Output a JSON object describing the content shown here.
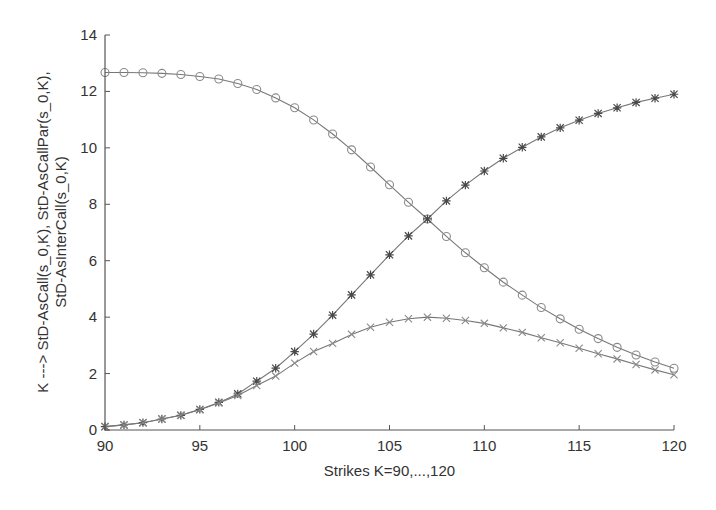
{
  "chart_data": {
    "type": "line",
    "title": "",
    "xlabel": "Strikes K=90,...,120",
    "ylabel_lines": [
      "K --->  StD-AsCall(s_0,K), StD-AsCallPar(s_0,K),",
      "StD-AsInterCall(s_0,K)"
    ],
    "xlim": [
      90,
      120
    ],
    "ylim": [
      0,
      14
    ],
    "xticks": [
      90,
      95,
      100,
      105,
      110,
      115,
      120
    ],
    "yticks": [
      0,
      2,
      4,
      6,
      8,
      10,
      12,
      14
    ],
    "grid": false,
    "legend": null,
    "x": [
      90,
      91,
      92,
      93,
      94,
      95,
      96,
      97,
      98,
      99,
      100,
      101,
      102,
      103,
      104,
      105,
      106,
      107,
      108,
      109,
      110,
      111,
      112,
      113,
      114,
      115,
      116,
      117,
      118,
      119,
      120
    ],
    "series": [
      {
        "name": "StD-AsCall(s_0,K)",
        "marker": "circle",
        "color": "#8a8a8a",
        "values": [
          12.67,
          12.67,
          12.66,
          12.64,
          12.6,
          12.53,
          12.44,
          12.28,
          12.07,
          11.77,
          11.42,
          10.99,
          10.49,
          9.93,
          9.32,
          8.69,
          8.07,
          7.48,
          6.86,
          6.28,
          5.75,
          5.24,
          4.78,
          4.34,
          3.94,
          3.57,
          3.24,
          2.93,
          2.66,
          2.41,
          2.19
        ]
      },
      {
        "name": "StD-AsCallPar(s_0,K)",
        "marker": "star",
        "color": "#4a4a4a",
        "values": [
          0.12,
          0.18,
          0.26,
          0.39,
          0.52,
          0.73,
          0.98,
          1.28,
          1.73,
          2.19,
          2.78,
          3.4,
          4.07,
          4.79,
          5.5,
          6.21,
          6.88,
          7.48,
          8.12,
          8.68,
          9.18,
          9.63,
          10.02,
          10.39,
          10.71,
          10.98,
          11.22,
          11.42,
          11.61,
          11.76,
          11.9
        ]
      },
      {
        "name": "StD-AsInterCall(s_0,K)",
        "marker": "x",
        "color": "#8a8a8a",
        "values": [
          0.12,
          0.18,
          0.26,
          0.39,
          0.52,
          0.72,
          0.96,
          1.22,
          1.58,
          1.91,
          2.37,
          2.78,
          3.07,
          3.39,
          3.64,
          3.82,
          3.94,
          4.0,
          3.96,
          3.88,
          3.78,
          3.62,
          3.46,
          3.27,
          3.09,
          2.9,
          2.7,
          2.52,
          2.32,
          2.13,
          1.96
        ]
      }
    ]
  },
  "layout": {
    "plot": {
      "x0": 105,
      "x1": 674,
      "y0": 430,
      "y1": 35
    },
    "line_color": "#777777"
  }
}
